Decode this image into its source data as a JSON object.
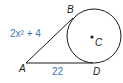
{
  "diagram": {
    "type": "circle-with-tangent-segments",
    "points": {
      "A": {
        "label": "A"
      },
      "B": {
        "label": "B"
      },
      "C": {
        "label": "C"
      },
      "D": {
        "label": "D"
      }
    },
    "segments": {
      "AB": {
        "label": "2x² + 4"
      },
      "AD": {
        "label": "22"
      }
    },
    "colors": {
      "stroke": "#1a1a1a",
      "measure_text": "#3a78b5",
      "point_label": "#1a1a1a"
    }
  }
}
